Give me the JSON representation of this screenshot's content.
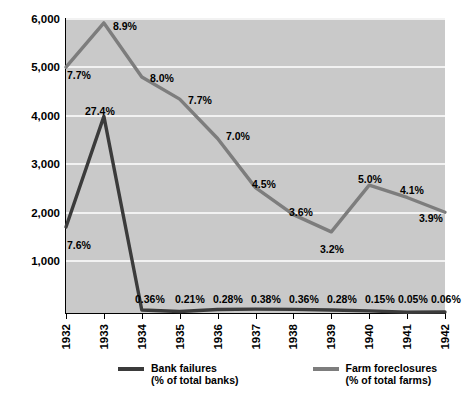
{
  "chart_data": {
    "type": "line",
    "title": "",
    "subtitle": "",
    "xlabel": "",
    "ylabel": "",
    "categories": [
      "1932",
      "1933",
      "1934",
      "1935",
      "1936",
      "1937",
      "1938",
      "1939",
      "1940",
      "1941",
      "1942"
    ],
    "ylim": [
      0,
      6000
    ],
    "yticks": [
      1000,
      2000,
      3000,
      4000,
      5000,
      6000
    ],
    "ytick_labels": [
      "1,000",
      "2,000",
      "3,000",
      "4,000",
      "5,000",
      "6,000"
    ],
    "grid": true,
    "legend_position": "bottom",
    "plot_background": "#c9c9c9",
    "gridline_color": "#f2f2f2",
    "series": [
      {
        "name": "Bank failures",
        "sublabel": "(% of total banks)",
        "color": "#3b3b3b",
        "values": [
          1750,
          4000,
          61,
          32,
          72,
          78,
          74,
          60,
          43,
          15,
          20
        ],
        "point_labels": [
          "7.6%",
          "27.4%",
          "0.36%",
          "0.21%",
          "0.28%",
          "0.38%",
          "0.36%",
          "0.28%",
          "0.15%",
          "0.05%",
          "0.06%"
        ]
      },
      {
        "name": "Farm foreclosures",
        "sublabel": "(% of total farms)",
        "color": "#7d7d7d",
        "values": [
          5000,
          5900,
          4800,
          4350,
          3550,
          2550,
          2000,
          1650,
          2600,
          2350,
          2050
        ],
        "point_labels": [
          "7.7%",
          "8.9%",
          "8.0%",
          "7.7%",
          "7.0%",
          "4.5%",
          "3.6%",
          "3.2%",
          "5.0%",
          "4.1%",
          "3.9%"
        ]
      }
    ]
  },
  "y_axis": {
    "labels": [
      "6,000",
      "5,000",
      "4,000",
      "3,000",
      "2,000",
      "1,000"
    ]
  },
  "x_axis": {
    "labels": [
      "1932",
      "1933",
      "1934",
      "1935",
      "1936",
      "1937",
      "1938",
      "1939",
      "1940",
      "1941",
      "1942"
    ]
  },
  "legend": {
    "items": [
      {
        "name": "Bank failures",
        "sublabel": "(% of total banks)",
        "color": "#3b3b3b"
      },
      {
        "name": "Farm foreclosures",
        "sublabel": "(% of total farms)",
        "color": "#7d7d7d"
      }
    ]
  },
  "bank_labels": {
    "y1932": "7.6%",
    "y1933": "27.4%",
    "y1934": "0.36%",
    "y1935": "0.21%",
    "y1936": "0.28%",
    "y1937": "0.38%",
    "y1938": "0.36%",
    "y1939": "0.28%",
    "y1940": "0.15%",
    "y1941": "0.05%",
    "y1942": "0.06%"
  },
  "farm_labels": {
    "y1932": "7.7%",
    "y1933": "8.9%",
    "y1934": "8.0%",
    "y1935": "7.7%",
    "y1936": "7.0%",
    "y1937": "4.5%",
    "y1938": "3.6%",
    "y1939": "3.2%",
    "y1940": "5.0%",
    "y1941": "4.1%",
    "y1942": "3.9%"
  }
}
